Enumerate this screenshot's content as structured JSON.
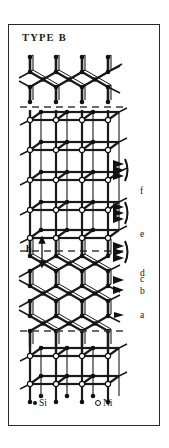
{
  "figure": {
    "title": "TYPE B",
    "kind": "crystal-structure-diagram",
    "frame": {
      "border_color": "#2a2a2a"
    },
    "measure": {
      "label": "h"
    },
    "legend": [
      {
        "symbol": "filled-circle",
        "label": "Si",
        "color": "#111111"
      },
      {
        "symbol": "open-circle",
        "label": "Ni",
        "color": "#111111"
      }
    ],
    "layer_labels": [
      {
        "id": "f",
        "label": "f",
        "marker": "triple-arrow-brace"
      },
      {
        "id": "e",
        "label": "e",
        "marker": "triple-arrow-brace"
      },
      {
        "id": "d",
        "label": "d",
        "marker": "triple-arrow-brace"
      },
      {
        "id": "c",
        "label": "c",
        "marker": "single-arrow"
      },
      {
        "id": "b",
        "label": "b",
        "marker": "single-arrow"
      },
      {
        "id": "a",
        "label": "a",
        "marker": "single-arrow"
      }
    ],
    "dashed_guides": 3,
    "atom_colors": {
      "si_fill": "#111111",
      "ni_fill": "#ffffff",
      "ni_stroke": "#111111",
      "bond": "#1a1a1a"
    }
  }
}
